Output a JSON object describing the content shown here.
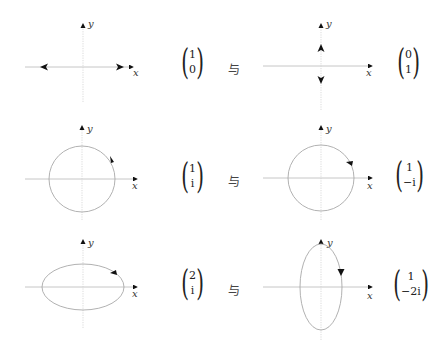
{
  "rows": [
    {
      "left": {
        "vector": [
          "1",
          "0"
        ],
        "curve": "linear-horizontal"
      },
      "conjunction": "与",
      "right": {
        "vector": [
          "0",
          "1"
        ],
        "curve": "linear-vertical"
      }
    },
    {
      "left": {
        "vector": [
          "1",
          "i"
        ],
        "curve": "circle-counterclockwise"
      },
      "conjunction": "与",
      "right": {
        "vector": [
          "1",
          "−i"
        ],
        "curve": "circle-clockwise"
      }
    },
    {
      "left": {
        "vector": [
          "2",
          "i"
        ],
        "curve": "ellipse-horizontal-counterclockwise"
      },
      "conjunction": "与",
      "right": {
        "vector": [
          "1",
          "−2i"
        ],
        "curve": "ellipse-vertical-clockwise"
      }
    }
  ],
  "axes": {
    "x_label": "x",
    "y_label": "y"
  },
  "colors": {
    "axis": "#b8b8b8",
    "curve": "#a8a8a8",
    "arrow": "#111111",
    "text": "#222222"
  }
}
